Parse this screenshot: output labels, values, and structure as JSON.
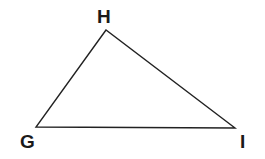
{
  "diagram": {
    "type": "triangle",
    "stroke_color": "#222222",
    "background": "#ffffff",
    "vertices": [
      {
        "name": "H",
        "x": 106,
        "y": 30
      },
      {
        "name": "G",
        "x": 36,
        "y": 127
      },
      {
        "name": "I",
        "x": 235,
        "y": 128
      }
    ],
    "labels": {
      "H": "H",
      "G": "G",
      "I": "I"
    }
  }
}
